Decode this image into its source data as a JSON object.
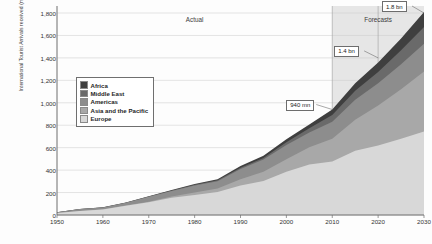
{
  "chart_data": {
    "type": "area",
    "title": "",
    "xlabel": "",
    "ylabel": "International Tourist Arrivals received (million)",
    "xlim": [
      1950,
      2030
    ],
    "ylim": [
      0,
      1800
    ],
    "ygrid": true,
    "ytick_step": 200,
    "xtick_step": 10,
    "xticks": [
      "1950",
      "1960",
      "1970",
      "1980",
      "1990",
      "2000",
      "2010",
      "2020",
      "2030"
    ],
    "yticks": [
      "0",
      "200",
      "400",
      "600",
      "800",
      "1,000",
      "1,200",
      "1,400",
      "1,600",
      "1,800"
    ],
    "stack_order_bottom_to_top": [
      "Europe",
      "Asia and the Pacific",
      "Americas",
      "Middle East",
      "Africa"
    ],
    "legend": {
      "position": "inside-left",
      "entries": [
        {
          "label": "Africa",
          "color": "#3f3f3f"
        },
        {
          "label": "Middle East",
          "color": "#6a6a6a"
        },
        {
          "label": "Americas",
          "color": "#8d8d8d"
        },
        {
          "label": "Asia and the Pacific",
          "color": "#a8a8a8"
        },
        {
          "label": "Europe",
          "color": "#d8d8d8"
        }
      ]
    },
    "period_labels": [
      {
        "text": "Actual",
        "x": 1980
      },
      {
        "text": "Forecasts",
        "x": 2020
      }
    ],
    "forecast_start": 2010,
    "annotations": [
      {
        "text": "940 mn",
        "year": 2010,
        "value": 940
      },
      {
        "text": "1.4 bn",
        "year": 2020,
        "value": 1400
      },
      {
        "text": "1.8 bn",
        "year": 2030,
        "value": 1800
      }
    ],
    "x": [
      1950,
      1955,
      1960,
      1965,
      1970,
      1975,
      1980,
      1985,
      1990,
      1995,
      2000,
      2005,
      2010,
      2015,
      2020,
      2025,
      2030
    ],
    "series": [
      {
        "name": "Europe",
        "values": [
          17,
          36,
          50,
          83,
          113,
          154,
          178,
          204,
          262,
          304,
          386,
          449,
          476,
          572,
          620,
          680,
          744
        ]
      },
      {
        "name": "Asia and the Pacific",
        "values": [
          0.2,
          0.5,
          0.9,
          2.1,
          6,
          10,
          23,
          32,
          56,
          82,
          110,
          154,
          204,
          277,
          355,
          440,
          535
        ]
      },
      {
        "name": "Americas",
        "values": [
          7.5,
          16,
          16,
          23,
          43,
          50,
          62,
          65,
          93,
          109,
          128,
          133,
          150,
          178,
          199,
          223,
          248
        ]
      },
      {
        "name": "Middle East",
        "values": [
          0.2,
          0.6,
          0.6,
          1.8,
          3,
          3.5,
          7,
          8,
          10,
          14,
          25,
          36,
          60,
          81,
          101,
          125,
          149
        ]
      },
      {
        "name": "Africa",
        "values": [
          0.5,
          0.8,
          0.8,
          1.4,
          3,
          5,
          7,
          9,
          15,
          20,
          26,
          35,
          50,
          66,
          85,
          105,
          134
        ]
      }
    ],
    "totals": [
      25,
      54,
      69,
      112,
      168,
      222,
      277,
      320,
      436,
      529,
      675,
      807,
      940,
      1174,
      1360,
      1573,
      1810
    ]
  }
}
